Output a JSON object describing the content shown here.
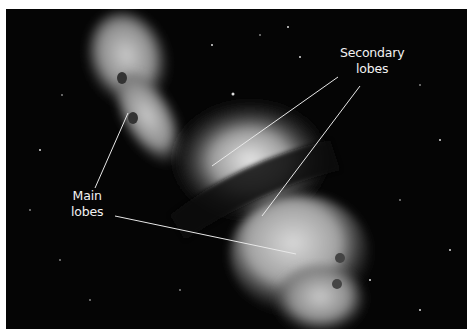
{
  "figure": {
    "background_color": "#050505",
    "border_color": "#ffffff",
    "labels": [
      {
        "id": "secondary",
        "line1": "Secondary",
        "line2": "lobes"
      },
      {
        "id": "main",
        "line1": "Main",
        "line2": "lobes"
      }
    ],
    "pointer_color": "#e8e8e8"
  }
}
